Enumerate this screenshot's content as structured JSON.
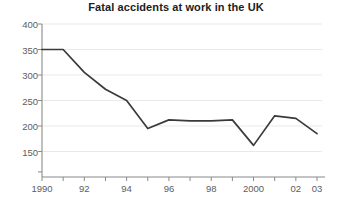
{
  "chart_data": {
    "type": "line",
    "title": "Fatal accidents at work in the UK",
    "xlabel": "",
    "ylabel": "",
    "x": [
      1990,
      1991,
      1992,
      1993,
      1994,
      1995,
      1996,
      1997,
      1998,
      1999,
      2000,
      2001,
      2002,
      2003
    ],
    "values": [
      350,
      350,
      305,
      272,
      250,
      195,
      212,
      210,
      210,
      212,
      162,
      220,
      215,
      185
    ],
    "series": [
      {
        "name": "Fatal accidents",
        "values": [
          350,
          350,
          305,
          272,
          250,
          195,
          212,
          210,
          210,
          212,
          162,
          220,
          215,
          185
        ]
      }
    ],
    "xlim": [
      1990,
      2003
    ],
    "ylim": [
      100,
      400
    ],
    "y_ticks": [
      150,
      200,
      250,
      300,
      350,
      400
    ],
    "y_tick_labels": [
      "150",
      "200",
      "250",
      "300",
      "350",
      "400"
    ],
    "x_ticks": [
      1990,
      1991,
      1992,
      1993,
      1994,
      1995,
      1996,
      1997,
      1998,
      1999,
      2000,
      2001,
      2002,
      2003
    ],
    "x_tick_labels": [
      {
        "value": 1990,
        "label": "1990"
      },
      {
        "value": 1992,
        "label": "92"
      },
      {
        "value": 1994,
        "label": "94"
      },
      {
        "value": 1996,
        "label": "96"
      },
      {
        "value": 1998,
        "label": "98"
      },
      {
        "value": 2000,
        "label": "2000"
      },
      {
        "value": 2002,
        "label": "02"
      },
      {
        "value": 2003,
        "label": "03"
      }
    ],
    "grid": {
      "horizontal": true,
      "vertical": false
    },
    "legend": {
      "visible": false,
      "position": "none"
    },
    "colors": {
      "line": "#3a3a3a",
      "grid": "#e9e9e9",
      "axis": "#8a8a8a",
      "text": "#5d5d5d",
      "title": "#1d1d1d",
      "background": "#ffffff"
    }
  }
}
